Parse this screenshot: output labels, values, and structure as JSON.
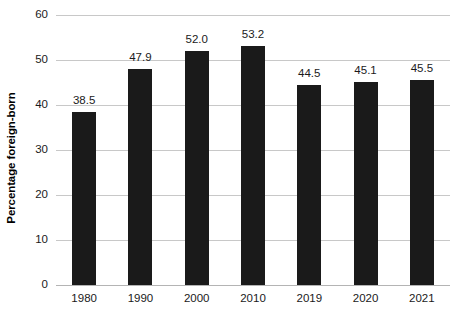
{
  "chart_data": {
    "type": "bar",
    "title": "",
    "subtitle": "",
    "xlabel": "",
    "ylabel": "Percentage foreign-born",
    "categories": [
      "1980",
      "1990",
      "2000",
      "2010",
      "2019",
      "2020",
      "2021"
    ],
    "values": [
      38.5,
      47.9,
      52.0,
      53.2,
      44.5,
      45.1,
      45.5
    ],
    "value_labels": [
      "38.5",
      "47.9",
      "52.0",
      "53.2",
      "44.5",
      "45.1",
      "45.5"
    ],
    "ylim": [
      0,
      60
    ],
    "ytick_values": [
      0,
      10,
      20,
      30,
      40,
      50,
      60
    ],
    "ytick_labels": [
      "0",
      "10",
      "20",
      "30",
      "40",
      "50",
      "60"
    ],
    "grid": true,
    "grid_axis": "y",
    "legend": false,
    "legend_position": "none",
    "bar_color": "#1a1a1a",
    "grid_color": "#c8c8c8",
    "background_color": "#ffffff",
    "text_color": "#1a1a1a"
  }
}
